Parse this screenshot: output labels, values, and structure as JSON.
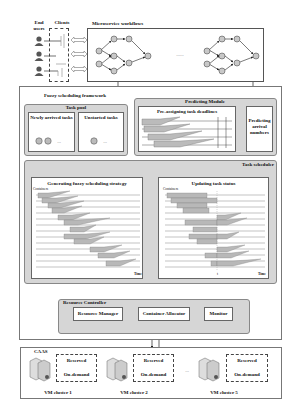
{
  "top": {
    "end_users_label": "End users",
    "clients_label": "Clients",
    "workflows_label": "Microservice workflows",
    "workflows_ellipsis": "......"
  },
  "framework": {
    "title": "Fuzzy scheduling framework",
    "task_pool": {
      "title": "Task pool",
      "newly_arrived": "Newly arrived tasks",
      "newly_arrived_items": [
        "1",
        "2"
      ],
      "unstarted": "Unstarted tasks",
      "unstarted_items": [
        "3"
      ],
      "ellipsis": "..."
    },
    "predicting_module": {
      "title": "Predicting Module",
      "pre_assigning": "Pre-assigning task deadlines",
      "predicting_arrival": "Predicting arrival numbers"
    },
    "task_scheduler": {
      "title": "Task scheduler",
      "generating": {
        "title": "Generating fuzzy scheduling strategy",
        "y_axis": "Containers",
        "x_axis": "Time"
      },
      "updating": {
        "title": "Updating task status",
        "y_axis": "Containers",
        "x_axis": "Time",
        "marker": "t"
      }
    },
    "resource_controller": {
      "title": "Resource Controller",
      "resource_manager": "Resource Manager",
      "container_allocator": "Container Allocator",
      "monitor": "Monitor"
    }
  },
  "caas": {
    "title": "CAAS",
    "clusters": [
      {
        "name": "VM cluster 1",
        "reserved": "Reserved",
        "on_demand": "On-demand"
      },
      {
        "name": "VM cluster 2",
        "reserved": "Reserved",
        "on_demand": "On-demand"
      },
      {
        "name": "VM cluster 5",
        "reserved": "Reserved",
        "on_demand": "On-demand"
      }
    ],
    "ellipsis": "..."
  },
  "colors": {
    "panel_gray": "#d6d6d6",
    "task_bar": "#b8b8b8",
    "node_fill": "#c8c8c8",
    "border": "#555555"
  }
}
